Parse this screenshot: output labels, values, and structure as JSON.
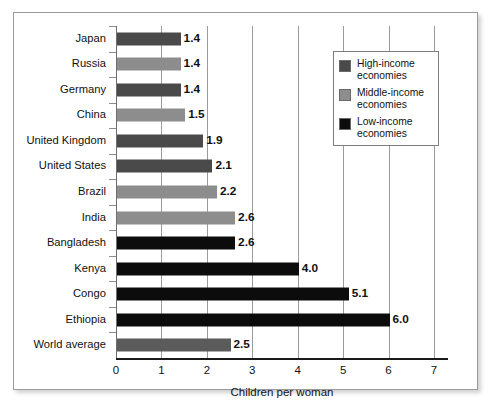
{
  "chart_data": {
    "type": "bar",
    "orientation": "horizontal",
    "title": "",
    "xlabel": "Children per woman",
    "ylabel": "",
    "xlim": [
      0,
      7.2
    ],
    "xticks": [
      "0",
      "1",
      "2",
      "3",
      "4",
      "5",
      "6",
      "7"
    ],
    "grid": true,
    "legend_position": "upper right",
    "categories": [
      "Japan",
      "Russia",
      "Germany",
      "China",
      "United Kingdom",
      "United States",
      "Brazil",
      "India",
      "Bangladesh",
      "Kenya",
      "Congo",
      "Ethiopia",
      "World average"
    ],
    "values": [
      1.4,
      1.4,
      1.4,
      1.5,
      1.9,
      2.1,
      2.2,
      2.6,
      2.6,
      4.0,
      5.1,
      6.0,
      2.5
    ],
    "value_labels": [
      "1.4",
      "1.4",
      "1.4",
      "1.5",
      "1.9",
      "2.1",
      "2.2",
      "2.6",
      "2.6",
      "4.0",
      "5.1",
      "6.0",
      "2.5"
    ],
    "groups": [
      "high",
      "middle",
      "high",
      "middle",
      "high",
      "high",
      "middle",
      "middle",
      "low",
      "low",
      "low",
      "low",
      "world"
    ],
    "series": [
      {
        "name": "High-income economies",
        "color": "#4a4a4a",
        "points": [
          {
            "category": "Japan",
            "value": 1.4
          },
          {
            "category": "Germany",
            "value": 1.4
          },
          {
            "category": "United Kingdom",
            "value": 1.9
          },
          {
            "category": "United States",
            "value": 2.1
          }
        ]
      },
      {
        "name": "Middle-income economies",
        "color": "#8d8d8d",
        "points": [
          {
            "category": "Russia",
            "value": 1.4
          },
          {
            "category": "China",
            "value": 1.5
          },
          {
            "category": "Brazil",
            "value": 2.2
          },
          {
            "category": "India",
            "value": 2.6
          }
        ]
      },
      {
        "name": "Low-income economies",
        "color": "#0c0c0c",
        "points": [
          {
            "category": "Bangladesh",
            "value": 2.6
          },
          {
            "category": "Kenya",
            "value": 4.0
          },
          {
            "category": "Congo",
            "value": 5.1
          },
          {
            "category": "Ethiopia",
            "value": 6.0
          }
        ]
      },
      {
        "name": "World average",
        "color": "#5b5b5b",
        "points": [
          {
            "category": "World average",
            "value": 2.5
          }
        ]
      }
    ]
  },
  "legend": {
    "items": [
      {
        "label_line1": "High-income",
        "label_line2": "economies",
        "swatch": "high",
        "color": "#4a4a4a"
      },
      {
        "label_line1": "Middle-income",
        "label_line2": "economies",
        "swatch": "middle",
        "color": "#8d8d8d"
      },
      {
        "label_line1": "Low-income",
        "label_line2": "economies",
        "swatch": "low",
        "color": "#0c0c0c"
      }
    ]
  }
}
